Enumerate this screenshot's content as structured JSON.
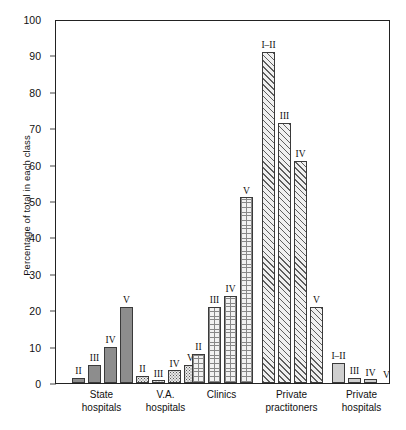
{
  "chart_data": {
    "type": "bar",
    "title": "",
    "subtitle": "",
    "xlabel": "",
    "ylabel": "Percentage of total in each class",
    "ylim": [
      0,
      100
    ],
    "ytick_labels": [
      "0",
      "10",
      "20",
      "30",
      "40",
      "50",
      "60",
      "70",
      "80",
      "90",
      "100"
    ],
    "ytick_values": [
      0,
      10,
      20,
      30,
      40,
      50,
      60,
      70,
      80,
      90,
      100
    ],
    "grid": false,
    "legend": "none",
    "categories": [
      "State hospitals",
      "V.A. hospitals",
      "Clinics",
      "Private practitoners",
      "Private hospitals"
    ],
    "groups": [
      {
        "name": "State hospitals",
        "caption_line1": "State",
        "caption_line2": "hospitals",
        "fill": "solid-gray",
        "bars": [
          {
            "label": "II",
            "value": 1.5
          },
          {
            "label": "III",
            "value": 5.0
          },
          {
            "label": "IV",
            "value": 10.0
          },
          {
            "label": "V",
            "value": 21.0
          }
        ]
      },
      {
        "name": "V.A. hospitals",
        "caption_line1": "V.A.",
        "caption_line2": "hospitals",
        "fill": "stipple",
        "bars": [
          {
            "label": "II",
            "value": 2.0
          },
          {
            "label": "III",
            "value": 0.8
          },
          {
            "label": "IV",
            "value": 3.5
          },
          {
            "label": "V",
            "value": 5.0
          }
        ]
      },
      {
        "name": "Clinics",
        "caption_line1": "Clinics",
        "caption_line2": "",
        "fill": "grid",
        "bars": [
          {
            "label": "II",
            "value": 8.0
          },
          {
            "label": "III",
            "value": 21.0
          },
          {
            "label": "IV",
            "value": 24.0
          },
          {
            "label": "V",
            "value": 51.0
          }
        ]
      },
      {
        "name": "Private practitoners",
        "caption_line1": "Private",
        "caption_line2": "practitoners",
        "fill": "hatch",
        "bars": [
          {
            "label": "I–II",
            "value": 91.0
          },
          {
            "label": "III",
            "value": 71.5
          },
          {
            "label": "IV",
            "value": 61.0
          },
          {
            "label": "V",
            "value": 21.0
          }
        ]
      },
      {
        "name": "Private hospitals",
        "caption_line1": "Private",
        "caption_line2": "hospitals",
        "fill": "light",
        "bars": [
          {
            "label": "I–II",
            "value": 5.5
          },
          {
            "label": "III",
            "value": 1.5
          },
          {
            "label": "IV",
            "value": 1.0
          },
          {
            "label": "V",
            "value": 0.0
          }
        ]
      }
    ],
    "colors": {
      "axis": "#222222",
      "solid_gray": "#8d8d8d",
      "light_gray": "#cfcfcf",
      "pattern_ink": "#5a5a5a",
      "background": "#ffffff"
    }
  }
}
